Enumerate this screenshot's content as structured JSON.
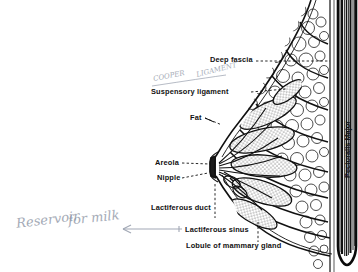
{
  "figure": {
    "background_color": "#ffffff",
    "ink_color": "#111111",
    "handwriting_color": "#8b93a3"
  },
  "labels": {
    "deep_fascia": "Deep fascia",
    "suspensory_ligament": "Suspensory ligament",
    "fat": "Fat",
    "areola": "Areola",
    "nipple": "Nipple",
    "lactiferous_duct": "Lactiferous duct",
    "lactiferous_sinus": "Lactiferous sinus",
    "lobule": "Lobule of mammary gland",
    "pectoralis_major": "Pectoralis Major"
  },
  "annotations": {
    "cooper": "COOPER",
    "ligament": "LIGAMENT",
    "reservoir": "Reservoir",
    "for_milk": "for milk"
  },
  "structures": [
    {
      "name": "pectoralis-major-muscle",
      "description": "vertical striated muscle band at right"
    },
    {
      "name": "deep-fascia-layer",
      "description": "thin line anterior to muscle"
    },
    {
      "name": "fat-tissue",
      "description": "rounded adipose lobules filling breast"
    },
    {
      "name": "suspensory-ligaments",
      "description": "cooper ligament strands"
    },
    {
      "name": "mammary-lobules",
      "description": "stippled glandular lobules radiating to nipple"
    },
    {
      "name": "lactiferous-ducts",
      "description": "ducts converging at nipple"
    },
    {
      "name": "nipple-areola",
      "description": "nipple and areola at left apex"
    }
  ]
}
